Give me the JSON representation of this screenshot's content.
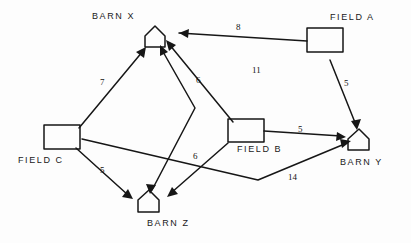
{
  "diagram": {
    "background_color": "#fdfdfd",
    "ink_color": "#161616",
    "nodes": [
      {
        "id": "barn_x",
        "label": "BARN X",
        "shape": "house",
        "x": 155,
        "y": 37,
        "label_x": 92,
        "label_y": 11
      },
      {
        "id": "field_a",
        "label": "FIELD A",
        "shape": "rectangle",
        "x": 325,
        "y": 44,
        "label_x": 330,
        "label_y": 12
      },
      {
        "id": "field_c",
        "label": "FIELD C",
        "shape": "rectangle",
        "x": 63,
        "y": 137,
        "label_x": 18,
        "label_y": 155
      },
      {
        "id": "field_b",
        "label": "FIELD B",
        "shape": "rectangle",
        "x": 245,
        "y": 130,
        "label_x": 237,
        "label_y": 144
      },
      {
        "id": "barn_y",
        "label": "BARN Y",
        "shape": "house",
        "x": 359,
        "y": 140,
        "label_x": 340,
        "label_y": 157
      },
      {
        "id": "barn_z",
        "label": "BARN Z",
        "shape": "house",
        "x": 149,
        "y": 201,
        "label_x": 147,
        "label_y": 218
      }
    ],
    "edges": [
      {
        "id": "a_to_x",
        "from": "FIELD A",
        "to": "BARN X",
        "weight": "8",
        "label_x": 236,
        "label_y": 22
      },
      {
        "id": "a_to_y",
        "from": "FIELD A",
        "to": "BARN Y",
        "weight": "5",
        "label_x": 344,
        "label_y": 78
      },
      {
        "id": "c_to_x",
        "from": "FIELD C",
        "to": "BARN X",
        "weight": "7",
        "label_x": 100,
        "label_y": 77
      },
      {
        "id": "c_to_z",
        "from": "FIELD C",
        "to": "BARN Z",
        "weight": "5",
        "label_x": 100,
        "label_y": 165
      },
      {
        "id": "c_to_y",
        "from": "FIELD C",
        "to": "BARN Y",
        "weight": "14",
        "label_x": 288,
        "label_y": 172
      },
      {
        "id": "b_to_x",
        "from": "FIELD B",
        "to": "BARN X",
        "weight": "11",
        "label_x": 252,
        "label_y": 65
      },
      {
        "id": "b_to_y",
        "from": "FIELD B",
        "to": "BARN Y",
        "weight": "5",
        "label_x": 298,
        "label_y": 124
      },
      {
        "id": "b_to_z",
        "from": "FIELD B",
        "to": "BARN Z",
        "weight": "6",
        "label_x": 193,
        "label_y": 151
      },
      {
        "id": "z_to_x",
        "from": "BARN Z",
        "to": "BARN X",
        "weight": "6",
        "label_x": 196,
        "label_y": 75
      }
    ]
  }
}
